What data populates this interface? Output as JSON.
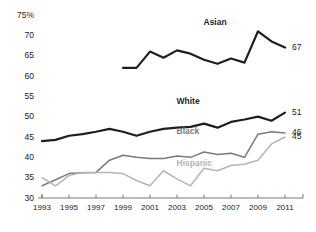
{
  "chart_data": {
    "type": "line",
    "title": "",
    "xlabel": "",
    "ylabel": "",
    "ylim": [
      30,
      75
    ],
    "xlim": [
      1993,
      2011
    ],
    "ytick_labels": [
      "75%",
      "70",
      "65",
      "60",
      "55",
      "50",
      "45",
      "40",
      "35",
      "30"
    ],
    "yticks": [
      75,
      70,
      65,
      60,
      55,
      50,
      45,
      40,
      35,
      30
    ],
    "xticks": [
      1993,
      1995,
      1997,
      1999,
      2001,
      2003,
      2005,
      2007,
      2009,
      2011
    ],
    "xtick_labels": [
      "1993",
      "1995",
      "1997",
      "1999",
      "2001",
      "2003",
      "2005",
      "2007",
      "2009",
      "2011"
    ],
    "grid": false,
    "legend_position": "inline-labels",
    "x": [
      1993,
      1994,
      1995,
      1996,
      1997,
      1998,
      1999,
      2000,
      2001,
      2002,
      2003,
      2004,
      2005,
      2006,
      2007,
      2008,
      2009,
      2010,
      2011
    ],
    "series": [
      {
        "name": "Asian",
        "color": "#1f1f1f",
        "width": 2.2,
        "label_x": 2006,
        "label_y": 73,
        "end_value": 67,
        "values": [
          null,
          null,
          null,
          null,
          null,
          null,
          62.0,
          62.0,
          66.0,
          64.5,
          66.3,
          65.5,
          64.0,
          63.0,
          64.3,
          63.3,
          71.0,
          68.5,
          67.0
        ]
      },
      {
        "name": "White",
        "color": "#1f1f1f",
        "width": 2.2,
        "label_x": 2004,
        "label_y": 53.5,
        "end_value": 51,
        "values": [
          44.0,
          44.3,
          45.3,
          45.7,
          46.3,
          47.0,
          46.3,
          45.3,
          46.3,
          47.0,
          47.3,
          47.5,
          48.3,
          47.3,
          48.7,
          49.3,
          50.0,
          49.0,
          51.0
        ]
      },
      {
        "name": "Black",
        "color": "#7a7a7a",
        "width": 1.5,
        "label_x": 2004,
        "label_y": 46.3,
        "end_value": 46,
        "values": [
          33.0,
          34.5,
          36.0,
          36.2,
          36.3,
          39.3,
          40.5,
          40.0,
          39.7,
          39.7,
          40.3,
          40.0,
          41.3,
          40.7,
          41.0,
          40.0,
          45.7,
          46.3,
          46.0
        ]
      },
      {
        "name": "Hispanic",
        "color": "#b5b5b5",
        "width": 1.5,
        "label_x": 2004,
        "label_y": 38.3,
        "end_value": 45,
        "values": [
          35.0,
          33.0,
          35.5,
          36.3,
          36.3,
          36.3,
          36.0,
          34.3,
          33.0,
          36.7,
          34.7,
          33.0,
          37.3,
          36.7,
          38.0,
          38.3,
          39.3,
          43.3,
          45.0
        ]
      }
    ]
  },
  "axis": {
    "y_labels": [
      "75%",
      "70",
      "65",
      "60",
      "55",
      "50",
      "45",
      "40",
      "35",
      "30"
    ],
    "x_labels": [
      "1993",
      "1995",
      "1997",
      "1999",
      "2001",
      "2003",
      "2005",
      "2007",
      "2009",
      "2011"
    ]
  },
  "series_names": {
    "asian": "Asian",
    "white": "White",
    "black": "Black",
    "hispanic": "Hispanic"
  },
  "end_labels": {
    "asian": "67",
    "white": "51",
    "black": "46",
    "hispanic": "45"
  },
  "colors": {
    "asian": "#1f1f1f",
    "white": "#1f1f1f",
    "black": "#7a7a7a",
    "hispanic": "#b5b5b5",
    "axis": "#6b6b6b",
    "text": "#1a1a1a"
  }
}
